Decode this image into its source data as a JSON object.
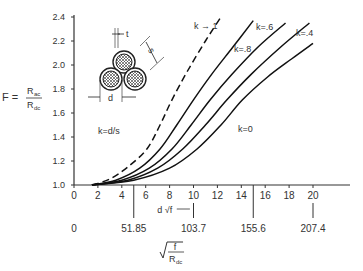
{
  "chart_data": {
    "type": "line",
    "title": "",
    "ylabel": "F = Rac / Rdc",
    "ylabel_parts": {
      "lhs": "F =",
      "num": "R",
      "num_sub": "ac",
      "den": "R",
      "den_sub": "dc"
    },
    "xlabel": "d √f",
    "xlabel_secondary": "√(f / Rdc)",
    "ylim": [
      1.0,
      2.4
    ],
    "xlim": [
      0,
      22
    ],
    "y_ticks": [
      "1.0",
      "1.2",
      "1.4",
      "1.6",
      "1.8",
      "2.0",
      "2.2",
      "2.4"
    ],
    "x_ticks": [
      "0",
      "2",
      "4",
      "6",
      "8",
      "10",
      "12",
      "14",
      "16",
      "18",
      "20"
    ],
    "x_secondary_ticks": [
      {
        "label": "0",
        "at": 0
      },
      {
        "label": "51.85",
        "at": 5
      },
      {
        "label": "103.7",
        "at": 10
      },
      {
        "label": "155.6",
        "at": 15
      },
      {
        "label": "207.4",
        "at": 20
      }
    ],
    "grid": false,
    "legend_note": "k=d/s",
    "inset": {
      "labels": {
        "t": "t",
        "s": "s",
        "d": "d"
      },
      "description": "three-conductor triplexed cable cross-section"
    },
    "series": [
      {
        "name": "k → 1",
        "label": "k → 1",
        "style": "dashed",
        "x": [
          1.5,
          3,
          4.5,
          6.1,
          7.2,
          8.2,
          9.5,
          11,
          12.3
        ],
        "y": [
          1.0,
          1.05,
          1.15,
          1.3,
          1.5,
          1.71,
          1.95,
          2.2,
          2.4
        ]
      },
      {
        "name": "k = .8",
        "label": "k=.8",
        "style": "solid",
        "x": [
          1.5,
          3.5,
          5.5,
          7.2,
          8.6,
          10,
          11.5,
          13.3,
          15
        ],
        "y": [
          1.0,
          1.04,
          1.14,
          1.3,
          1.5,
          1.71,
          1.92,
          2.15,
          2.37
        ]
      },
      {
        "name": "k = .6",
        "label": "k=.6",
        "style": "solid",
        "x": [
          1.5,
          4,
          6.3,
          8.2,
          9.8,
          11.4,
          13.2,
          15.4,
          17.7
        ],
        "y": [
          1.0,
          1.04,
          1.14,
          1.3,
          1.5,
          1.71,
          1.92,
          2.15,
          2.35
        ]
      },
      {
        "name": "k = .4",
        "label": "k=.4",
        "style": "solid",
        "x": [
          1.5,
          4.5,
          7,
          9.1,
          11,
          12.8,
          14.8,
          17.3,
          19.7
        ],
        "y": [
          1.0,
          1.04,
          1.14,
          1.3,
          1.5,
          1.71,
          1.92,
          2.15,
          2.35
        ]
      },
      {
        "name": "k = 0",
        "label": "k=0",
        "style": "solid",
        "x": [
          1.5,
          5,
          8,
          10.3,
          12.3,
          14.1,
          16.2,
          18.2,
          20
        ],
        "y": [
          1.0,
          1.04,
          1.14,
          1.3,
          1.5,
          1.71,
          1.9,
          2.05,
          2.18
        ]
      }
    ]
  }
}
